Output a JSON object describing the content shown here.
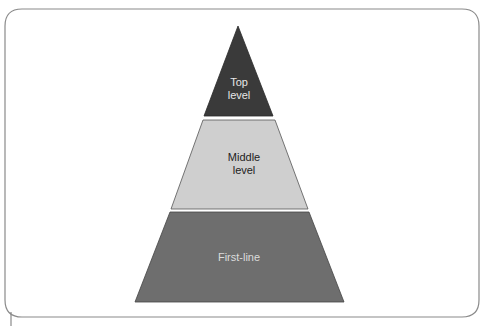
{
  "diagram": {
    "type": "pyramid",
    "levels": [
      {
        "id": "top",
        "label": "Top\nlevel",
        "fill": "#3a3a3a",
        "text_color": "#e6e6e6"
      },
      {
        "id": "middle",
        "label": "Middle\nlevel",
        "fill": "#cfcfcf",
        "text_color": "#222222"
      },
      {
        "id": "first-line",
        "label": "First-line",
        "fill": "#6e6e6e",
        "text_color": "#dcdcdc"
      }
    ],
    "frame": {
      "stroke": "#8a8a8a"
    }
  }
}
